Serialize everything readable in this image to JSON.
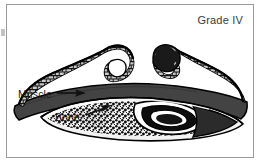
{
  "figure": {
    "type": "medical-illustration",
    "grade_label": "Grade IV",
    "frame_color": "#9a9a9a",
    "background_color": "#ffffff"
  },
  "labels": {
    "muscle": "Muscle",
    "bone": "Bone"
  },
  "colors": {
    "outline": "#000000",
    "muscle_fill": "#434343",
    "cortex_fill": "#6e6e6e",
    "trabecular_fill": "#c9c9c9",
    "marrow_fill": "#ffffff",
    "text": "#1c1c1c",
    "caption_text": "#3a3a3a"
  },
  "annotations": [
    {
      "name": "muscle-callout",
      "text": "Muscle",
      "arrow": "points-right"
    },
    {
      "name": "bone-callout",
      "text": "Bone",
      "arrow": "points-upper-right"
    }
  ]
}
